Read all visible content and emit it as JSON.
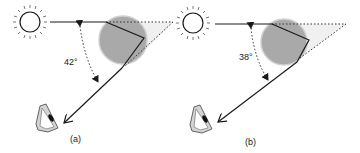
{
  "figure": {
    "panels": [
      {
        "id": "a",
        "caption": "(a)",
        "angle_label": "42°"
      },
      {
        "id": "b",
        "caption": "(b)",
        "angle_label": "38°"
      }
    ],
    "colors": {
      "stroke": "#1a1a1a",
      "droplet_fill": "#a8a8a8",
      "droplet_edge": "#c8c8c8",
      "cone_fill": "#eeeeee",
      "eye_fill": "#d0d0d0"
    },
    "icons": [
      "sun-icon",
      "raindrop-icon",
      "eye-icon",
      "arrow-icon"
    ]
  }
}
